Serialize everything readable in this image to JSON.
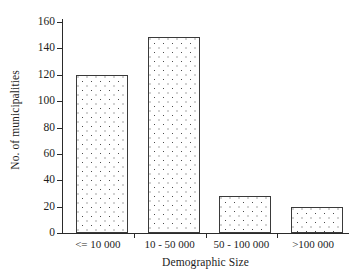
{
  "chart_data": {
    "type": "bar",
    "title": "",
    "subtitle": "",
    "categories": [
      "<= 10 000",
      "10 - 50 000",
      "50 - 100 000",
      ">100 000"
    ],
    "values": [
      120,
      149,
      28,
      20
    ],
    "xlabel": "Demographic Size",
    "ylabel": "No. of municipalities",
    "ylim": [
      0,
      160
    ],
    "yticks": [
      0,
      20,
      40,
      60,
      80,
      100,
      120,
      140,
      160
    ],
    "ytick_labels": [
      "0",
      "20",
      "40",
      "60",
      "80",
      "100",
      "120",
      "140",
      "160"
    ],
    "grid": false,
    "legend": null,
    "annotations": [],
    "series": [
      {
        "name": "No. of municipalities",
        "values": [
          120,
          149,
          28,
          20
        ]
      }
    ],
    "style": {
      "bar_fill": "#ffffff",
      "bar_pattern": "dotted",
      "bar_outline": "#3a3a3a",
      "axis_color": "#2a2a2a",
      "text_color": "#1c1c1c",
      "background": "#ffffff"
    }
  }
}
